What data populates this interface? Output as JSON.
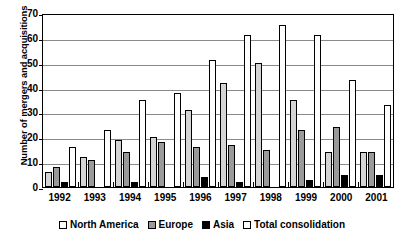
{
  "chart_data": {
    "type": "bar",
    "title": "",
    "xlabel": "",
    "ylabel": "Number of mergers and acquisitions",
    "categories": [
      "1992",
      "1993",
      "1994",
      "1995",
      "1996",
      "1997",
      "1998",
      "1999",
      "2000",
      "2001"
    ],
    "series": [
      {
        "name": "North America",
        "color": "#d4d4d4",
        "values": [
          6,
          12,
          19,
          20,
          31,
          42,
          50,
          35,
          14,
          14
        ]
      },
      {
        "name": "Europe",
        "color": "#9a9a9a",
        "values": [
          8,
          11,
          14,
          18,
          16,
          17,
          15,
          23,
          24,
          14
        ]
      },
      {
        "name": "Asia",
        "color": "#000000",
        "values": [
          2,
          0,
          2,
          0,
          4,
          2,
          0,
          3,
          5,
          5
        ]
      },
      {
        "name": "Total consolidation",
        "color": "#ffffff",
        "values": [
          16,
          23,
          35,
          38,
          51,
          61,
          65,
          61,
          43,
          33
        ]
      }
    ],
    "ylim": [
      0,
      70
    ],
    "yticks": [
      0,
      10,
      20,
      30,
      40,
      50,
      60,
      70
    ],
    "ytick_labels": [
      "0",
      "10",
      "20",
      "30",
      "40",
      "50",
      "60",
      "70"
    ],
    "grid": true,
    "legend_position": "bottom"
  }
}
